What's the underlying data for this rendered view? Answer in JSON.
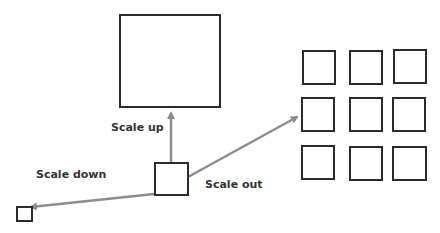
{
  "diagram": {
    "labels": {
      "scale_up": "Scale up",
      "scale_down": "Scale down",
      "scale_out": "Scale out"
    },
    "colors": {
      "box_stroke": "#2b2b2b",
      "arrow": "#8c8c8c",
      "text": "#333333"
    },
    "nodes": [
      {
        "id": "original",
        "desc": "medium square (origin)"
      },
      {
        "id": "scaled-up",
        "desc": "large square"
      },
      {
        "id": "scaled-down",
        "desc": "tiny square"
      },
      {
        "id": "scaled-out",
        "desc": "3x3 grid of squares"
      }
    ]
  }
}
